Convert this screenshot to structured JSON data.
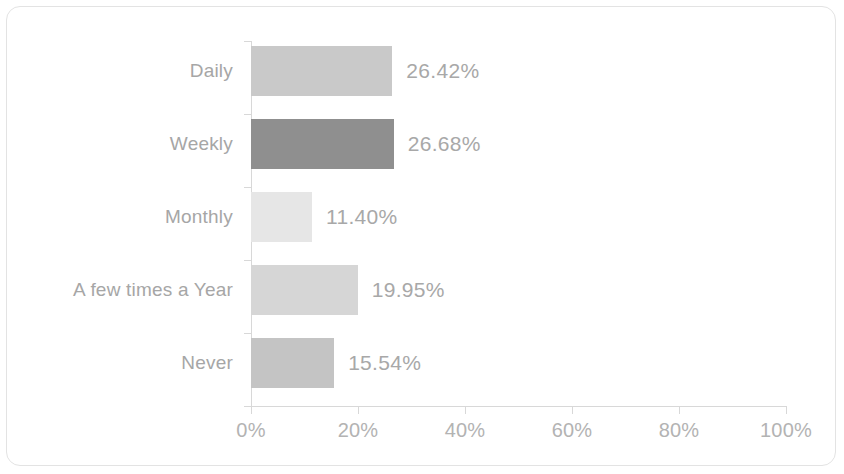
{
  "chart_data": {
    "type": "bar",
    "orientation": "horizontal",
    "title": "",
    "subtitle": "",
    "xlabel": "",
    "ylabel": "",
    "grid": false,
    "legend": "none",
    "xlim": [
      0,
      100
    ],
    "x_tick_labels": [
      "0%",
      "20%",
      "40%",
      "60%",
      "80%",
      "100%"
    ],
    "x_ticks": [
      0,
      20,
      40,
      60,
      80,
      100
    ],
    "categories": [
      "Daily",
      "Weekly",
      "Monthly",
      "A few times a Year",
      "Never"
    ],
    "values": [
      26.42,
      26.68,
      11.4,
      19.95,
      15.54
    ],
    "data_labels": [
      "26.42%",
      "26.68%",
      "11.40%",
      "19.95%",
      "15.54%"
    ],
    "bar_colors": [
      "#c9c9c9",
      "#8f8f8f",
      "#e6e6e6",
      "#d6d6d6",
      "#c4c4c4"
    ]
  },
  "style": {
    "frame_border_color": "#e3e3e3",
    "axis_color": "#d8d8d8",
    "category_label_color": "#a6a6a6",
    "value_label_color": "#a8a8a8",
    "tick_label_color": "#b3b3b3",
    "background": "#ffffff"
  }
}
